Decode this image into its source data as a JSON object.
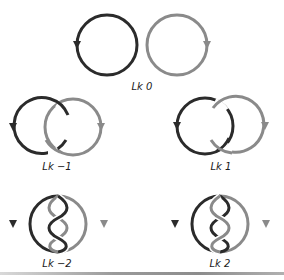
{
  "figure": {
    "panels": [
      {
        "id": "lk0",
        "label": "Lk 0",
        "linking_number": 0,
        "crossings": 0,
        "description": "two separate unlinked rings"
      },
      {
        "id": "lk-neg1",
        "label": "Lk −1",
        "linking_number": -1,
        "crossings": 2,
        "description": "singly linked rings, negative"
      },
      {
        "id": "lk1",
        "label": "Lk 1",
        "linking_number": 1,
        "crossings": 2,
        "description": "singly linked rings, positive"
      },
      {
        "id": "lk-neg2",
        "label": "Lk −2",
        "linking_number": -2,
        "crossings": 4,
        "description": "doubly intertwined rings, negative"
      },
      {
        "id": "lk2",
        "label": "Lk 2",
        "linking_number": 2,
        "crossings": 4,
        "description": "doubly intertwined rings, positive"
      }
    ],
    "colors": {
      "strand_dark": "#2b2b2b",
      "strand_gray": "#8a8a8a",
      "background": "#ffffff"
    }
  }
}
